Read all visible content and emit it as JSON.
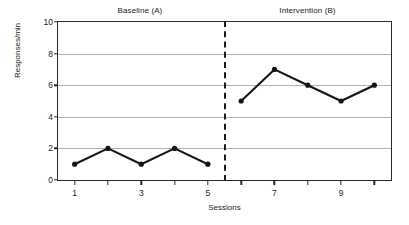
{
  "chart_data": {
    "type": "line",
    "title": "",
    "xlabel": "Sessions",
    "ylabel": "Responses/min",
    "xlim": [
      0.5,
      10.5
    ],
    "ylim": [
      0,
      10
    ],
    "grid": true,
    "legend_position": "none",
    "x": [
      1,
      2,
      3,
      4,
      5,
      6,
      7,
      8,
      9,
      10
    ],
    "xticks": [
      1,
      2,
      3,
      4,
      5,
      6,
      7,
      8,
      9,
      10
    ],
    "xtick_labels": [
      "1",
      "",
      "3",
      "",
      "5",
      "",
      "7",
      "",
      "9",
      ""
    ],
    "yticks": [
      0,
      2,
      4,
      6,
      8,
      10
    ],
    "ytick_labels": [
      "0",
      "2",
      "4",
      "6",
      "8",
      "10"
    ],
    "series": [
      {
        "name": "Baseline (A)",
        "x": [
          1,
          2,
          3,
          4,
          5
        ],
        "values": [
          1,
          2,
          1,
          2,
          1
        ]
      },
      {
        "name": "Intervention (B)",
        "x": [
          6,
          7,
          8,
          9,
          10
        ],
        "values": [
          5,
          7,
          6,
          5,
          6
        ]
      }
    ],
    "annotations": [
      {
        "name": "phase-a-label",
        "text": "Baseline (A)"
      },
      {
        "name": "phase-b-label",
        "text": "Intervention (B)"
      },
      {
        "name": "phase-change-line",
        "text": "",
        "x": 5.5,
        "style": "dashed"
      }
    ]
  },
  "labels": {
    "phase_a": "Baseline (A)",
    "phase_b": "Intervention (B)",
    "y_axis": "Responses/min",
    "x_axis": "Sessions"
  },
  "colors": {
    "series": "#151515",
    "grid": "#b2b2b2",
    "frame": "#2a2a2a",
    "background": "#ffffff"
  }
}
